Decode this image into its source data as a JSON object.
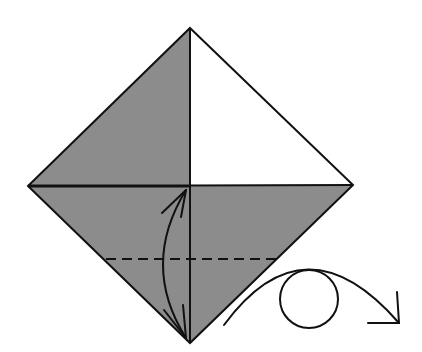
{
  "diagram": {
    "type": "origami-fold-instruction",
    "colors": {
      "background": "#ffffff",
      "paper_colored": "#8c8c8c",
      "paper_white": "#ffffff",
      "line": "#111111"
    },
    "square": {
      "top": [
        190,
        28
      ],
      "right": [
        353,
        185
      ],
      "bottom": [
        190,
        343
      ],
      "left": [
        28,
        186
      ],
      "center": [
        190,
        186
      ]
    },
    "regions": [
      {
        "name": "upper-left-triangle",
        "fill": "colored"
      },
      {
        "name": "upper-right-triangle",
        "fill": "white"
      },
      {
        "name": "lower-half",
        "fill": "colored"
      }
    ],
    "fold_line": {
      "style": "valley-dashed",
      "y": 259,
      "x_start": 106,
      "x_end": 277
    },
    "fold_arrow": {
      "type": "double-headed-curved",
      "from": [
        188,
        188
      ],
      "to": [
        188,
        340
      ],
      "bulge_x": 160
    },
    "turn_over_symbol": {
      "label": "turn over",
      "arc_start": [
        224,
        325
      ],
      "arc_peak": [
        305,
        271
      ],
      "arc_end": [
        399,
        323
      ],
      "circle_center": [
        309,
        299
      ],
      "circle_radius": 29
    }
  }
}
